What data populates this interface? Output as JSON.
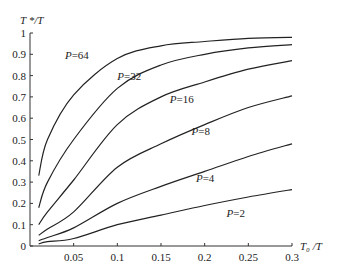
{
  "chart_data": {
    "type": "line",
    "title": "",
    "xlabel": "T0/T",
    "ylabel": "T*/T",
    "xlim": [
      0,
      0.3
    ],
    "ylim": [
      0,
      1
    ],
    "grid": false,
    "legend": "inline labels",
    "x_ticks": [
      "0.05",
      "0.1",
      "0.15",
      "0.2",
      "0.25",
      "0.3"
    ],
    "y_ticks": [
      "0",
      "0.1",
      "0.2",
      "0.3",
      "0.4",
      "0.5",
      "0.6",
      "0.7",
      "0.8",
      "0.9",
      "1"
    ],
    "x": [
      0.01,
      0.02,
      0.05,
      0.1,
      0.15,
      0.2,
      0.25,
      0.3
    ],
    "series": [
      {
        "name": "P=64",
        "label": "P=64",
        "values": [
          0.33,
          0.5,
          0.71,
          0.88,
          0.94,
          0.96,
          0.975,
          0.98
        ]
      },
      {
        "name": "P=32",
        "label": "P=32",
        "values": [
          0.18,
          0.3,
          0.5,
          0.74,
          0.85,
          0.9,
          0.93,
          0.945
        ]
      },
      {
        "name": "P=16",
        "label": "P=16",
        "values": [
          0.1,
          0.16,
          0.31,
          0.57,
          0.7,
          0.77,
          0.83,
          0.87
        ]
      },
      {
        "name": "P=8",
        "label": "P=8",
        "values": [
          0.05,
          0.08,
          0.16,
          0.37,
          0.48,
          0.57,
          0.65,
          0.705
        ]
      },
      {
        "name": "P=4",
        "label": "P=4",
        "values": [
          0.025,
          0.04,
          0.085,
          0.2,
          0.28,
          0.35,
          0.42,
          0.48
        ]
      },
      {
        "name": "P=2",
        "label": "P=2",
        "values": [
          0.01,
          0.02,
          0.035,
          0.1,
          0.145,
          0.19,
          0.23,
          0.265
        ]
      }
    ],
    "label_positions": [
      {
        "x": 0.04,
        "y": 0.88
      },
      {
        "x": 0.1,
        "y": 0.78
      },
      {
        "x": 0.16,
        "y": 0.67
      },
      {
        "x": 0.185,
        "y": 0.52
      },
      {
        "x": 0.19,
        "y": 0.3
      },
      {
        "x": 0.225,
        "y": 0.135
      }
    ]
  },
  "axes": {
    "x_title": "T₀ /T",
    "y_title": "T */T"
  }
}
